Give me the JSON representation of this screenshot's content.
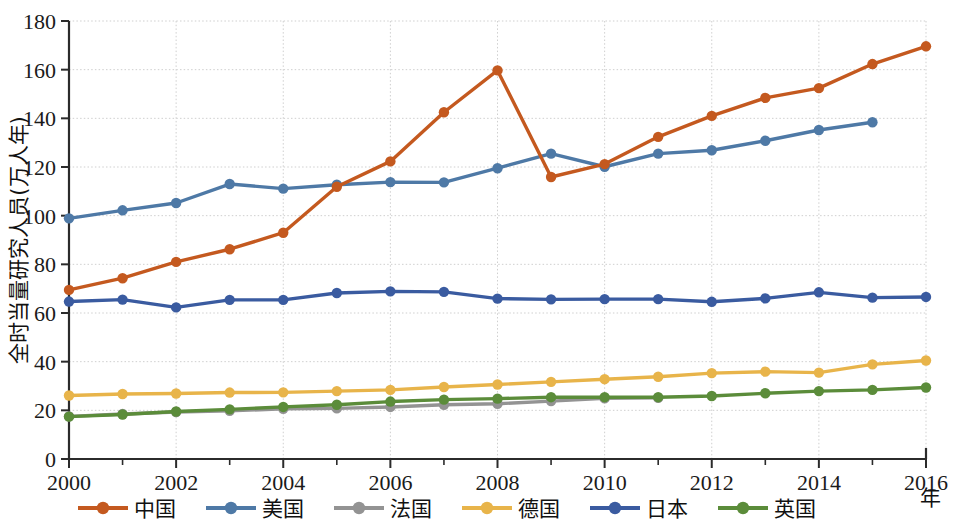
{
  "chart_data": {
    "type": "line",
    "title": "",
    "xlabel": "年",
    "ylabel": "全时当量研究人员(万人年)",
    "x": [
      2000,
      2001,
      2002,
      2003,
      2004,
      2005,
      2006,
      2007,
      2008,
      2009,
      2010,
      2011,
      2012,
      2013,
      2014,
      2015,
      2016
    ],
    "xlim": [
      2000,
      2016
    ],
    "ylim": [
      0,
      180
    ],
    "xticks_major": [
      2000,
      2002,
      2004,
      2006,
      2008,
      2010,
      2012,
      2014,
      2016
    ],
    "xticks_minor": [
      2001,
      2003,
      2005,
      2007,
      2009,
      2011,
      2013,
      2015
    ],
    "yticks": [
      0,
      20,
      40,
      60,
      80,
      100,
      120,
      140,
      160,
      180
    ],
    "grid": true,
    "legend_position": "bottom",
    "series": [
      {
        "name": "中国",
        "color": "#C4591F",
        "x": [
          2000,
          2001,
          2002,
          2003,
          2004,
          2005,
          2006,
          2007,
          2008,
          2009,
          2010,
          2011,
          2012,
          2013,
          2014,
          2015,
          2016
        ],
        "values": [
          69.5,
          74.3,
          81.0,
          86.2,
          93.0,
          111.9,
          122.3,
          142.5,
          159.7,
          115.9,
          121.2,
          132.4,
          141.0,
          148.4,
          152.4,
          162.3,
          169.6
        ]
      },
      {
        "name": "美国",
        "color": "#4E79A6",
        "x": [
          2000,
          2001,
          2002,
          2003,
          2004,
          2005,
          2006,
          2007,
          2008,
          2009,
          2010,
          2011,
          2012,
          2013,
          2014,
          2015
        ],
        "values": [
          98.9,
          102.2,
          105.2,
          113.0,
          111.1,
          112.7,
          113.8,
          113.7,
          119.5,
          125.5,
          120.1,
          125.5,
          126.9,
          130.8,
          135.2,
          138.4
        ]
      },
      {
        "name": "法国",
        "color": "#939393",
        "x": [
          2000,
          2001,
          2002,
          2003,
          2004,
          2005,
          2006,
          2007,
          2008,
          2009,
          2010,
          2011
        ],
        "values": [
          17.5,
          18.5,
          19.3,
          19.8,
          20.6,
          20.8,
          21.4,
          22.3,
          22.7,
          23.8,
          24.9,
          25.1
        ]
      },
      {
        "name": "德国",
        "color": "#E8B44A",
        "x": [
          2000,
          2001,
          2002,
          2003,
          2004,
          2005,
          2006,
          2007,
          2008,
          2009,
          2010,
          2011,
          2012,
          2013,
          2014,
          2015,
          2016
        ],
        "values": [
          26.1,
          26.7,
          26.9,
          27.3,
          27.4,
          27.9,
          28.4,
          29.6,
          30.6,
          31.7,
          32.8,
          33.8,
          35.3,
          35.9,
          35.5,
          38.9,
          40.5
        ]
      },
      {
        "name": "日本",
        "color": "#3A5BA0",
        "x": [
          2000,
          2001,
          2002,
          2003,
          2004,
          2005,
          2006,
          2007,
          2008,
          2009,
          2010,
          2011,
          2012,
          2013,
          2014,
          2015,
          2016
        ],
        "values": [
          64.7,
          65.5,
          62.3,
          65.4,
          65.4,
          68.2,
          68.9,
          68.7,
          65.9,
          65.6,
          65.7,
          65.7,
          64.6,
          66.0,
          68.5,
          66.3,
          66.6
        ]
      },
      {
        "name": "英国",
        "color": "#5B8C3A",
        "x": [
          2000,
          2001,
          2002,
          2003,
          2004,
          2005,
          2006,
          2007,
          2008,
          2009,
          2010,
          2011,
          2012,
          2013,
          2014,
          2015,
          2016
        ],
        "values": [
          17.4,
          18.3,
          19.5,
          20.4,
          21.4,
          22.3,
          23.6,
          24.4,
          24.8,
          25.4,
          25.4,
          25.4,
          25.9,
          27.0,
          27.9,
          28.4,
          29.4
        ]
      }
    ]
  },
  "axes": {
    "y_title": "全时当量研究人员(万人年)",
    "x_title": "年",
    "y_tick_labels": [
      "0",
      "20",
      "40",
      "60",
      "80",
      "100",
      "120",
      "140",
      "160",
      "180"
    ],
    "x_tick_labels": [
      "2000",
      "2002",
      "2004",
      "2006",
      "2008",
      "2010",
      "2012",
      "2014",
      "2016"
    ]
  },
  "legend": {
    "items": [
      {
        "label": "中国",
        "color": "#C4591F"
      },
      {
        "label": "美国",
        "color": "#4E79A6"
      },
      {
        "label": "法国",
        "color": "#939393"
      },
      {
        "label": "德国",
        "color": "#E8B44A"
      },
      {
        "label": "日本",
        "color": "#3A5BA0"
      },
      {
        "label": "英国",
        "color": "#5B8C3A"
      }
    ]
  }
}
